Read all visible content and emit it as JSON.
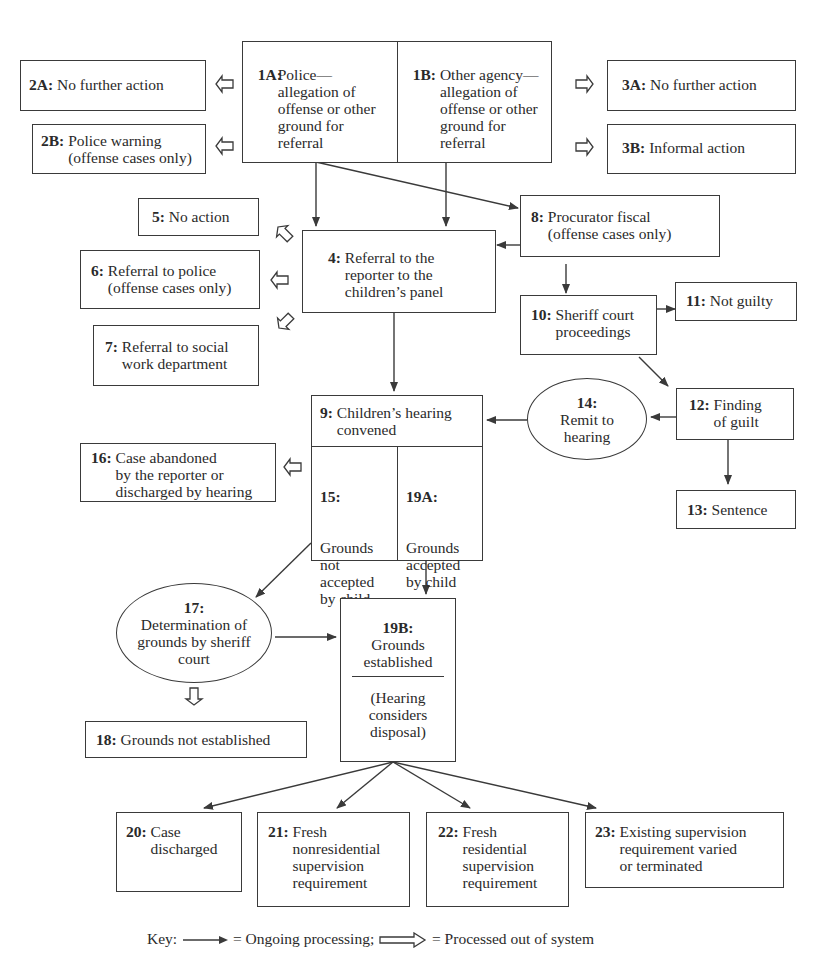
{
  "nodes": {
    "n1A": {
      "id": "1A:",
      "text": "Police—\nallegation of\noffense or other\nground for\nreferral"
    },
    "n1B": {
      "id": "1B:",
      "text": "Other agency—\nallegation of\noffense or other\nground for\nreferral"
    },
    "n2A": {
      "id": "2A:",
      "text": "No further action"
    },
    "n2B": {
      "id": "2B:",
      "text": "Police warning\n(offense cases only)"
    },
    "n3A": {
      "id": "3A:",
      "text": "No further action"
    },
    "n3B": {
      "id": "3B:",
      "text": "Informal action"
    },
    "n4": {
      "id": "4:",
      "text": "Referral to the\nreporter to the\nchildren’s panel"
    },
    "n5": {
      "id": "5:",
      "text": "No action"
    },
    "n6": {
      "id": "6:",
      "text": "Referral to police\n(offense cases only)"
    },
    "n7": {
      "id": "7:",
      "text": "Referral to social\nwork department"
    },
    "n8": {
      "id": "8:",
      "text": "Procurator fiscal\n(offense cases only)"
    },
    "n9": {
      "id": "9:",
      "text": "Children’s hearing\nconvened"
    },
    "n10": {
      "id": "10:",
      "text": "Sheriff court\nproceedings"
    },
    "n11": {
      "id": "11:",
      "text": "Not guilty"
    },
    "n12": {
      "id": "12:",
      "text": "Finding\nof guilt"
    },
    "n13": {
      "id": "13:",
      "text": "Sentence"
    },
    "n14": {
      "id": "14:",
      "text": "Remit to\nhearing"
    },
    "n15": {
      "id": "15:",
      "text": "Grounds\nnot\naccepted\nby child"
    },
    "n16": {
      "id": "16:",
      "text": "Case abandoned\nby the reporter or\ndischarged by hearing"
    },
    "n17": {
      "id": "17:",
      "text": "Determination of\ngrounds by sheriff\ncourt"
    },
    "n18": {
      "id": "18:",
      "text": "Grounds not established"
    },
    "n19A": {
      "id": "19A:",
      "text": "Grounds\naccepted\nby child"
    },
    "n19B": {
      "id": "19B:",
      "text": "Grounds\nestablished",
      "subtext": "(Hearing\nconsiders\ndisposal)"
    },
    "n20": {
      "id": "20:",
      "text": "Case\ndischarged"
    },
    "n21": {
      "id": "21:",
      "text": "Fresh\nnonresidential\nsupervision\nrequirement"
    },
    "n22": {
      "id": "22:",
      "text": "Fresh\nresidential\nsupervision\nrequirement"
    },
    "n23": {
      "id": "23:",
      "text": "Existing supervision\nrequirement varied\nor terminated"
    }
  },
  "key": {
    "label": "Key:",
    "ongoing": "= Ongoing processing;",
    "out": "= Processed out of system"
  },
  "colors": {
    "line": "#3a3a3a",
    "text": "#2a2a2a",
    "background": "#ffffff"
  }
}
